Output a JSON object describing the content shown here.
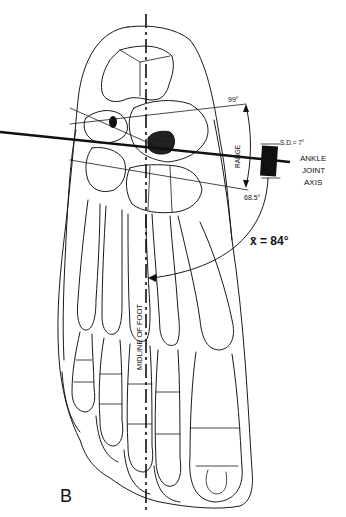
{
  "figure": {
    "panel_label": "B",
    "midline_label": "MIDLINE OF FOOT",
    "axis_label_lines": [
      "ANKLE",
      "JOINT",
      "AXIS"
    ],
    "range_label": "RANGE",
    "range_max": "99°",
    "range_min": "68.5°",
    "sd_label": "S.D.= 7°",
    "mean_label": "x̄ = 84°",
    "colors": {
      "ink": "#111111",
      "background": "#ffffff"
    }
  }
}
